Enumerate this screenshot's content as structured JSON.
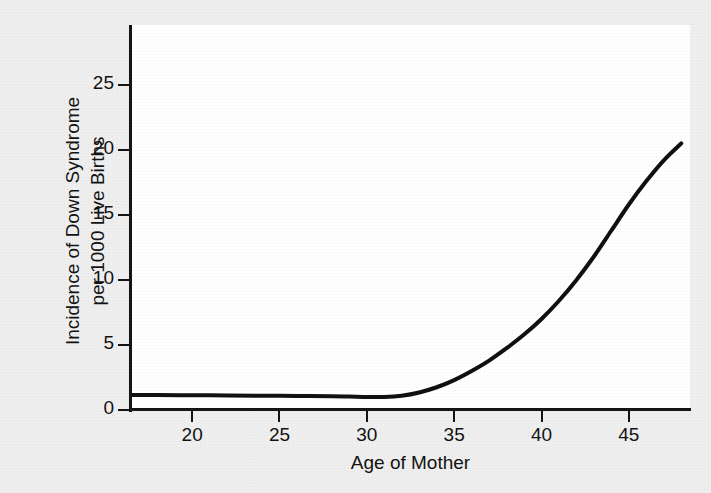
{
  "figure": {
    "background_color": "#efefef",
    "plot_background_color": "#ffffff",
    "axis_color": "#111111",
    "curve_color": "#0d0d0d"
  },
  "axes": {
    "x_title": "Age of Mother",
    "y_title_line1": "Incidence of Down Syndrome",
    "y_title_line2": "per 1000 Live Births"
  },
  "chart_data": {
    "type": "line",
    "title": "",
    "subtitle": "",
    "xlabel": "Age of Mother",
    "ylabel": "Incidence of Down Syndrome per 1000 Live Births",
    "xlim": [
      16.5,
      48.5
    ],
    "ylim": [
      0,
      29.6
    ],
    "xticks": [
      20,
      25,
      30,
      35,
      40,
      45
    ],
    "xtick_labels": [
      "20",
      "25",
      "30",
      "35",
      "40",
      "45"
    ],
    "yticks": [
      0,
      5,
      10,
      15,
      20,
      25
    ],
    "ytick_labels": [
      "0",
      "5",
      "10",
      "15",
      "20",
      "25"
    ],
    "grid": false,
    "legend": null,
    "legend_position": "none",
    "annotations": [],
    "series": [
      {
        "name": "Incidence of Down Syndrome per 1000 live births",
        "color": "#0d0d0d",
        "line_width": 4,
        "x": [
          16.5,
          18,
          20,
          22,
          24,
          26,
          28,
          29,
          30,
          31,
          32,
          33,
          34,
          35,
          36,
          37,
          38,
          39,
          40,
          41,
          42,
          43,
          44,
          45,
          46,
          47,
          48
        ],
        "y": [
          1.15,
          1.15,
          1.13,
          1.12,
          1.1,
          1.08,
          1.05,
          1.03,
          1.0,
          1.0,
          1.1,
          1.35,
          1.75,
          2.3,
          3.0,
          3.8,
          4.75,
          5.8,
          7.0,
          8.4,
          10.0,
          11.8,
          13.8,
          15.8,
          17.6,
          19.2,
          20.5
        ]
      }
    ]
  }
}
